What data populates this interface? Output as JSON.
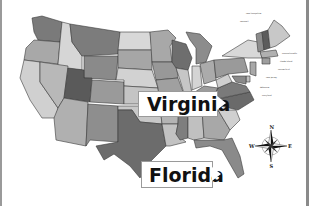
{
  "map": {
    "title": "United States map",
    "style": "grayscale",
    "highlighted_labels": [
      {
        "text": "Virginia"
      },
      {
        "text": "Florida"
      }
    ],
    "compass": {
      "north": "N",
      "south": "S",
      "east": "E",
      "west": "W"
    },
    "northeast_callouts": [
      "new hampshire",
      "vermont",
      "massachusetts",
      "rhode island",
      "connecticut",
      "new jersey",
      "delaware",
      "maryland"
    ],
    "colors": {
      "background": "#ffffff",
      "light_state": "#d6d6d6",
      "mid_state": "#a8a8a8",
      "dark_state": "#6e6e6e",
      "border": "#3a3a3a"
    }
  }
}
